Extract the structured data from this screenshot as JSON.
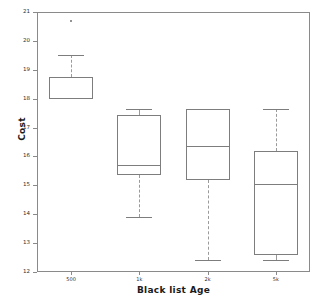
{
  "chart_data": {
    "type": "box",
    "title": "",
    "xlabel": "Black list Age",
    "ylabel": "Cost",
    "categories": [
      "500",
      "1k",
      "2k",
      "5k"
    ],
    "ylim": [
      12,
      21
    ],
    "yticks": [
      12,
      13,
      14,
      15,
      16,
      17,
      18,
      19,
      20,
      21
    ],
    "ytick_labels": [
      "12",
      "13",
      "14",
      "15",
      "16",
      "17",
      "18",
      "19",
      "20",
      "21"
    ],
    "grid": false,
    "legend": "none",
    "boxes": [
      {
        "category": "500",
        "whisker_low": 18.0,
        "q1": 18.0,
        "median": null,
        "q3": 18.75,
        "whisker_high": 19.5,
        "outliers": [
          20.7
        ]
      },
      {
        "category": "1k",
        "whisker_low": 13.9,
        "q1": 15.35,
        "median": 15.7,
        "q3": 17.45,
        "whisker_high": 17.65,
        "outliers": []
      },
      {
        "category": "2k",
        "whisker_low": 12.4,
        "q1": 15.2,
        "median": 16.35,
        "q3": 17.65,
        "whisker_high": 17.65,
        "outliers": []
      },
      {
        "category": "5k",
        "whisker_low": 12.4,
        "q1": 12.6,
        "median": 15.05,
        "q3": 16.2,
        "whisker_high": 17.65,
        "outliers": []
      }
    ]
  },
  "colors": {
    "box_line": "#7d7d7d",
    "whisker_line": "#9a9a9a",
    "axis_line": "#8a8a8a",
    "text": "#1b1b1b",
    "background": "#ffffff"
  }
}
